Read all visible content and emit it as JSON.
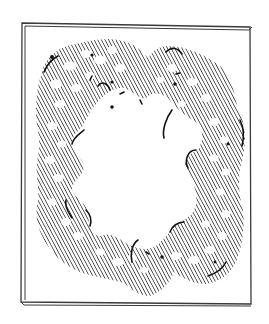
{
  "image": {
    "subject": "Hatched wreath drawing in a framed panel",
    "colors": {
      "background": "#ffffff",
      "ink": "#2a2a2a",
      "frame": "#3a3a3a",
      "hatch": "#333333",
      "accent_dark": "#111111"
    },
    "frame": {
      "outer": {
        "x1": 22,
        "y1": 23,
        "x2": 251,
        "y2": 304
      },
      "inner_offset": 2
    },
    "ring": {
      "fill_style": "diagonal-hatch",
      "hatch_angle_deg": 62,
      "hatch_spacing_px": 3
    }
  }
}
